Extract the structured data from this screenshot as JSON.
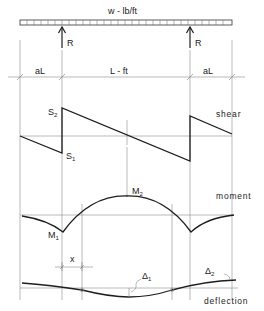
{
  "load": {
    "label": "w - lb/ft"
  },
  "supports": {
    "left_label": "R",
    "right_label": "R"
  },
  "spans": {
    "left_overhang": "aL",
    "main_span": "L - ft",
    "right_overhang": "aL"
  },
  "shear": {
    "caption": "shear",
    "s2_label": "S",
    "s2_sub": "2",
    "s1_label": "S",
    "s1_sub": "1"
  },
  "moment": {
    "caption": "moment",
    "m2_label": "M",
    "m2_sub": "2",
    "m1_label": "M",
    "m1_sub": "1"
  },
  "deflection": {
    "caption": "deflection",
    "x_label": "x",
    "d1_label": "Δ",
    "d1_sub": "1",
    "d2_label": "Δ",
    "d2_sub": "2"
  },
  "colors": {
    "line": "#1e1e1e",
    "guide": "#8a8a8a",
    "background": "#ffffff"
  }
}
